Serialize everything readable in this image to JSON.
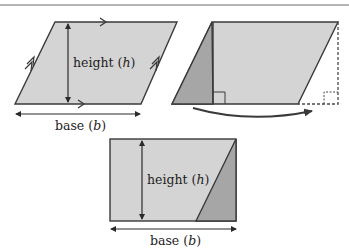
{
  "figure": {
    "colors": {
      "shape_fill": "#d4d4d4",
      "cut_fill": "#a6a6a6",
      "stroke": "#3a3a3a",
      "rule": "#5a5a5a",
      "background": "#ffffff"
    },
    "panels": [
      {
        "id": "parallelogram",
        "height_label": "height (",
        "height_var": "h",
        "height_close": ")",
        "base_label": "base (",
        "base_var": "b",
        "base_close": ")"
      },
      {
        "id": "cut-and-move",
        "description": "Triangle cut from left side moved to right side"
      },
      {
        "id": "rectangle",
        "height_label": "height (",
        "height_var": "h",
        "height_close": ")",
        "base_label": "base (",
        "base_var": "b",
        "base_close": ")"
      }
    ]
  }
}
